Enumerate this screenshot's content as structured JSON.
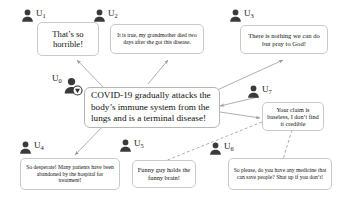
{
  "diagram": {
    "colors": {
      "avatar": "#3a3a3a",
      "bubble_border": "#c9c9c9",
      "bubble_fill": "#ffffff",
      "arrow": "#9a9a9a",
      "text": "#111111"
    }
  },
  "nodes": [
    {
      "id": "u0",
      "label": "U",
      "subscript": "0",
      "verified": true,
      "badge_icon": "verified-check-icon",
      "message": "COVID-19 gradually attacks the body’s immune system from the lungs and is a terminal disease!"
    },
    {
      "id": "u1",
      "label": "U",
      "subscript": "1",
      "verified": false,
      "message": "That’s so horrible!"
    },
    {
      "id": "u2",
      "label": "U",
      "subscript": "2",
      "verified": false,
      "message": "It is true, my grandmother died two days after she got this disease."
    },
    {
      "id": "u3",
      "label": "U",
      "subscript": "3",
      "verified": false,
      "message": "There is nothing we can do but pray to God!"
    },
    {
      "id": "u4",
      "label": "U",
      "subscript": "4",
      "verified": false,
      "message": "So desperate! Many patients have been abandoned by the hospital for treatment!"
    },
    {
      "id": "u5",
      "label": "U",
      "subscript": "5",
      "verified": false,
      "message": "Funny guy holds the funny brain!"
    },
    {
      "id": "u6",
      "label": "U",
      "subscript": "6",
      "verified": false,
      "message": "So please, do you have any medicine that can save people? Shut up if you don’t!"
    },
    {
      "id": "u7",
      "label": "U",
      "subscript": "7",
      "verified": false,
      "message": "Your claim is baseless, I don’t find it credible"
    }
  ],
  "edges": [
    {
      "from": "u0",
      "to": "u1",
      "style": "solid"
    },
    {
      "from": "u0",
      "to": "u2",
      "style": "solid"
    },
    {
      "from": "u0",
      "to": "u3",
      "style": "solid"
    },
    {
      "from": "u0",
      "to": "u4",
      "style": "solid"
    },
    {
      "from": "u0",
      "to": "u7",
      "style": "solid"
    },
    {
      "from": "u7",
      "to": "u5",
      "style": "dashed"
    },
    {
      "from": "u7",
      "to": "u6",
      "style": "solid"
    }
  ]
}
